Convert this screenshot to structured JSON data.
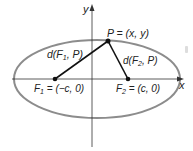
{
  "diagram": {
    "type": "ellipse-foci",
    "axes": {
      "x_label": "x",
      "y_label": "y"
    },
    "ellipse": {
      "stroke": "#8c8c8c"
    },
    "points": {
      "F1": {
        "label_main": "F",
        "label_sub": "1",
        "label_rest": " = (−c, 0)"
      },
      "F2": {
        "label_main": "F",
        "label_sub": "2",
        "label_rest": " = (c, 0)"
      },
      "P": {
        "label": "P = (x, y)"
      }
    },
    "segments": {
      "d1": {
        "pre": "d(F",
        "sub": "1",
        "post": ", P)"
      },
      "d2": {
        "pre": "d(F",
        "sub": "2",
        "post": ", P)"
      }
    },
    "colors": {
      "axis": "#333333",
      "ellipse": "#8c8c8c",
      "segment": "#111111",
      "point": "#111111",
      "label_gray": "#555555"
    }
  }
}
